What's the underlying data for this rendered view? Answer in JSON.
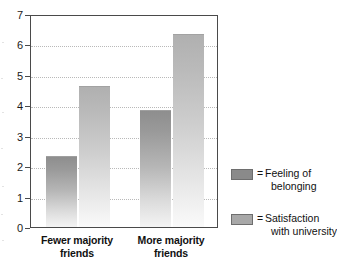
{
  "chart_data": {
    "type": "bar",
    "title": "",
    "subtitle": "",
    "xlabel": "",
    "ylabel": "",
    "ylim": [
      0,
      7
    ],
    "yticks": [
      0,
      1,
      2,
      3,
      4,
      5,
      6,
      7
    ],
    "ytick_labels": [
      "0",
      "1",
      "2",
      "3",
      "4",
      "5",
      "6",
      "7"
    ],
    "grid": true,
    "grid_style": "dotted horizontal",
    "legend_position": "right",
    "categories": [
      "Fewer majority friends",
      "More majority friends"
    ],
    "category_lines": [
      [
        "Fewer majority",
        "friends"
      ],
      [
        "More majority",
        "friends"
      ]
    ],
    "series": [
      {
        "name": "Feeling of belonging",
        "name_lines": [
          "Feeling of",
          "belonging"
        ],
        "color": "#8a8a8a",
        "values": [
          2.3,
          3.8
        ]
      },
      {
        "name": "Satisfaction with university",
        "name_lines": [
          "Satisfaction",
          "with university"
        ],
        "color": "#a8a8a8",
        "values": [
          4.6,
          6.3
        ]
      }
    ],
    "legend_equals_sign": "="
  },
  "colors": {
    "axis": "#4a4a4a",
    "gridline": "#b9b9b9",
    "text": "#111111",
    "background": "#ffffff",
    "series_dark": "#8a8a8a",
    "series_light": "#a8a8a8"
  }
}
